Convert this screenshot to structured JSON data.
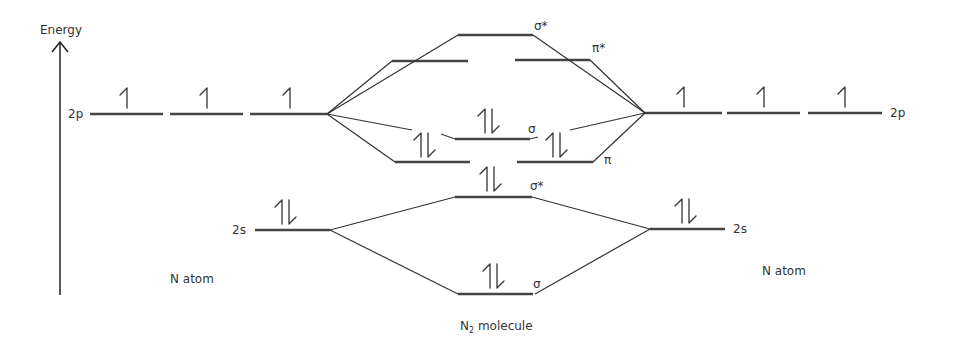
{
  "axis": {
    "label": "Energy"
  },
  "labels": {
    "left_atom": "N atom",
    "right_atom": "N atom",
    "molecule": "N",
    "molecule_sub": "2",
    "molecule_suffix": " molecule",
    "left_2p": "2p",
    "right_2p": "2p",
    "left_2s": "2s",
    "right_2s": "2s",
    "sigma_star_2p": "σ*",
    "pi_star_2p": "π*",
    "sigma_2p": "σ",
    "pi_2p": "π",
    "sigma_star_2s": "σ*",
    "sigma_2s": "σ"
  },
  "levels": {
    "atom_left": [
      {
        "name": "2p",
        "electrons": [
          1,
          1,
          1
        ]
      },
      {
        "name": "2s",
        "electrons": [
          2
        ]
      }
    ],
    "atom_right": [
      {
        "name": "2p",
        "electrons": [
          1,
          1,
          1
        ]
      },
      {
        "name": "2s",
        "electrons": [
          2
        ]
      }
    ],
    "molecule": [
      {
        "name": "σ*2p",
        "electrons": 0
      },
      {
        "name": "π*2p",
        "electrons": [
          0,
          0
        ]
      },
      {
        "name": "σ2p",
        "electrons": 2
      },
      {
        "name": "π2p",
        "electrons": [
          2,
          2
        ]
      },
      {
        "name": "σ*2s",
        "electrons": 2
      },
      {
        "name": "σ2s",
        "electrons": 2
      }
    ]
  }
}
